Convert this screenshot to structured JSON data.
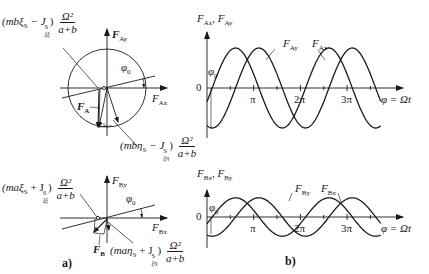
{
  "panels": {
    "a_label": "a)",
    "b_label": "b)"
  },
  "diagram_A": {
    "axis_y_label": "F",
    "axis_y_sub": "Ay",
    "axis_x_label": "F",
    "axis_x_sub": "Ax",
    "angle_label": "φ",
    "angle_sub": "0",
    "force_label": "F",
    "force_sub": "A",
    "term1_prefix": "(mbξ",
    "term1_prefix_sub": "S",
    "term1_minus": " − J",
    "term1_J_sup": "S",
    "term1_J_sub": "ξξ",
    "term1_close": ")",
    "term2_prefix": "(mbη",
    "term2_prefix_sub": "S",
    "term2_minus": " − J",
    "term2_J_sup": "S",
    "term2_J_sub": "ξη",
    "term2_close": ")",
    "frac_num": "Ω²",
    "frac_den": "a+b"
  },
  "diagram_B": {
    "axis_y_label": "F",
    "axis_y_sub": "By",
    "axis_x_label": "F",
    "axis_x_sub": "Bx",
    "angle_label": "φ",
    "angle_sub": "0",
    "force_label": "F",
    "force_sub": "B",
    "term1_prefix": "(maξ",
    "term1_prefix_sub": "S",
    "term1_plus": " + J",
    "term1_J_sup": "S",
    "term1_J_sub": "ξξ",
    "term1_close": ")",
    "term2_prefix": "(maη",
    "term2_prefix_sub": "S",
    "term2_plus": " + J",
    "term2_J_sup": "S",
    "term2_J_sub": "ξη",
    "term2_close": ")",
    "frac_num": "Ω²",
    "frac_den": "a+b"
  },
  "chart_data": [
    {
      "type": "line",
      "title": "",
      "ylabel": "F_Ax, F_Ay",
      "xlabel": "φ = Ωt",
      "x_ticks": [
        "π",
        "2π",
        "3π"
      ],
      "zero_label": "0",
      "phase_label": "φ0",
      "series": [
        {
          "name": "F_Ay",
          "label": "F_Ay",
          "function": "A·sin(φ − φ0)",
          "amplitude": 1.0
        },
        {
          "name": "F_Ax",
          "label": "F_Ax",
          "function": "−A·cos(φ − φ0)",
          "amplitude": 1.0
        }
      ],
      "xlim": [
        0,
        3.75
      ],
      "x_unit": "π",
      "grid": false
    },
    {
      "type": "line",
      "title": "",
      "ylabel": "F_Bx, F_By",
      "xlabel": "φ = Ωt",
      "x_ticks": [
        "π",
        "2π",
        "3π"
      ],
      "zero_label": "0",
      "phase_label": "φ0",
      "series": [
        {
          "name": "F_By",
          "label": "F_By",
          "function": "B·sin(φ − φ0)",
          "amplitude": 0.48
        },
        {
          "name": "F_Bx",
          "label": "F_Bx",
          "function": "−B·cos(φ − φ0)",
          "amplitude": 0.48
        }
      ],
      "xlim": [
        0,
        3.75
      ],
      "x_unit": "π",
      "grid": false
    }
  ],
  "chart_labels": {
    "top": {
      "ylabel_F1": "F",
      "ylabel_s1": "Ax",
      "ylabel_sep": ", ",
      "ylabel_F2": "F",
      "ylabel_s2": "Ay",
      "s1_F": "F",
      "s1_sub": "Ay",
      "s2_F": "F",
      "s2_sub": "Ax",
      "zero": "0",
      "phi0": "φ",
      "phi0_sub": "0",
      "tick_pi": "π",
      "tick_2pi": "2π",
      "tick_3pi": "3π",
      "xlabel": "φ = Ωt"
    },
    "bottom": {
      "ylabel_F1": "F",
      "ylabel_s1": "Bx",
      "ylabel_sep": ", ",
      "ylabel_F2": "F",
      "ylabel_s2": "By",
      "s1_F": "F",
      "s1_sub": "By",
      "s2_F": "F",
      "s2_sub": "Bx",
      "zero": "0",
      "phi0": "φ",
      "phi0_sub": "0",
      "tick_pi": "π",
      "tick_2pi": "2π",
      "tick_3pi": "3π",
      "xlabel": "φ = Ωt"
    }
  }
}
